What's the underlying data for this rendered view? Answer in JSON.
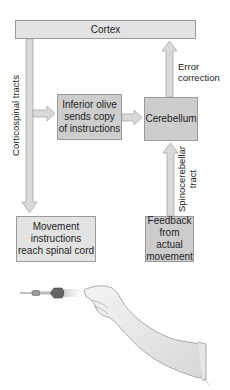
{
  "diagram": {
    "nodes": {
      "cortex": {
        "label": "Cortex"
      },
      "inferior_olive": {
        "label": "Inferior olive\nsends copy\nof instructions"
      },
      "cerebellum": {
        "label": "Cerebellum"
      },
      "movement": {
        "label": "Movement\ninstructions\nreach spinal cord"
      },
      "feedback": {
        "label": "Feedback\nfrom actual\nmovement"
      }
    },
    "edges": [
      {
        "from": "cortex",
        "to": "movement",
        "label": "Corticospinal tracts"
      },
      {
        "from": "corticospinal_tracts",
        "to": "inferior_olive",
        "label": ""
      },
      {
        "from": "inferior_olive",
        "to": "cerebellum",
        "label": ""
      },
      {
        "from": "cerebellum",
        "to": "cortex",
        "label": "Error correction"
      },
      {
        "from": "feedback",
        "to": "cerebellum",
        "label": "Spinocerebellar tract"
      }
    ],
    "edge_labels": {
      "corticospinal": "Corticospinal tracts",
      "error_correction": "Error\ncorrection",
      "spinocerebellar": "Spinocerebellar\ntract"
    },
    "illustration": "arm-throwing-dart"
  },
  "colors": {
    "light_box": "#e3e3e3",
    "dark_box": "#cdcdcd",
    "arrow_fill": "#d9d9d9",
    "arrow_stroke": "#a8a8a8"
  }
}
